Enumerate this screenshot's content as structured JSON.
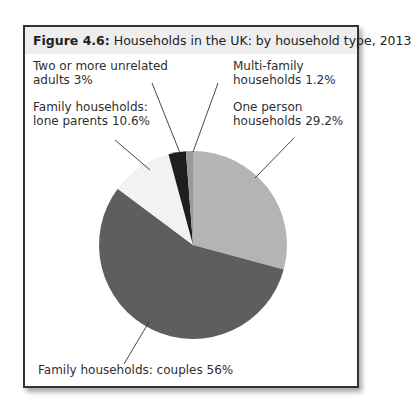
{
  "figure": {
    "number_label": "Figure 4.6:",
    "title": "Households in the UK: by household type, 2013"
  },
  "labels": {
    "two_or_more": {
      "line1": "Two or more unrelated",
      "line2": "adults 3%"
    },
    "lone_parents": {
      "line1": "Family households:",
      "line2": "lone parents 10.6%"
    },
    "multi_family": {
      "line1": "Multi-family",
      "line2": "households 1.2%"
    },
    "one_person": {
      "line1": "One person",
      "line2": "households 29.2%"
    },
    "couples": {
      "line1": "Family households: couples 56%"
    }
  },
  "colors": {
    "one_person": "#b4b4b4",
    "couples": "#5e5e5e",
    "lone_parents": "#f2f2f2",
    "two_or_more": "#1e1e1e",
    "multi_family": "#9a9a9a",
    "frame": "#333333",
    "title_bg": "#eeeeee"
  },
  "chart_data": {
    "type": "pie",
    "title": "Figure 4.6: Households in the UK: by household type, 2013",
    "categories": [
      "One person households",
      "Family households: couples",
      "Family households: lone parents",
      "Two or more unrelated adults",
      "Multi-family households"
    ],
    "values": [
      29.2,
      56,
      10.6,
      3,
      1.2
    ],
    "units": "%",
    "start_angle": "12 o'clock",
    "direction": "clockwise",
    "legend": "none (direct labels with leader lines)"
  }
}
